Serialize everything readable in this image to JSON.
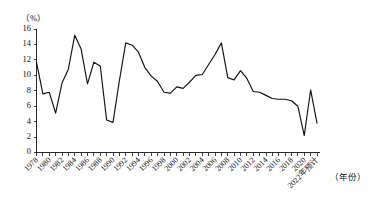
{
  "chart_data": {
    "type": "line",
    "title": "",
    "xlabel": "（年份）",
    "ylabel": "（%）",
    "ylim": [
      0,
      16
    ],
    "ytick_step": 2,
    "yticks": [
      0,
      2,
      4,
      6,
      8,
      10,
      12,
      14,
      16
    ],
    "grid": false,
    "legend": "none",
    "x": [
      "1978",
      "1979",
      "1980",
      "1981",
      "1982",
      "1983",
      "1984",
      "1985",
      "1986",
      "1987",
      "1988",
      "1989",
      "1990",
      "1991",
      "1992",
      "1993",
      "1994",
      "1995",
      "1996",
      "1997",
      "1998",
      "1999",
      "2000",
      "2001",
      "2002",
      "2003",
      "2004",
      "2005",
      "2006",
      "2007",
      "2008",
      "2009",
      "2010",
      "2011",
      "2012",
      "2013",
      "2014",
      "2015",
      "2016",
      "2017",
      "2018",
      "2019",
      "2020",
      "2021",
      "2022"
    ],
    "xtick_labels": [
      "1978",
      "1980",
      "1982",
      "1984",
      "1986",
      "1988",
      "1990",
      "1992",
      "1994",
      "1996",
      "1998",
      "2000",
      "2002",
      "2004",
      "2006",
      "2008",
      "2010",
      "2012",
      "2014",
      "2016",
      "2018",
      "2020",
      "2022年预计"
    ],
    "values": [
      11.7,
      7.6,
      7.8,
      5.1,
      9.0,
      10.8,
      15.2,
      13.4,
      8.9,
      11.7,
      11.2,
      4.2,
      3.9,
      9.3,
      14.2,
      13.9,
      13.0,
      11.0,
      9.9,
      9.2,
      7.8,
      7.7,
      8.5,
      8.3,
      9.1,
      10.0,
      10.1,
      11.4,
      12.7,
      14.2,
      9.7,
      9.4,
      10.6,
      9.6,
      7.9,
      7.8,
      7.4,
      7.0,
      6.9,
      6.9,
      6.7,
      6.0,
      2.2,
      8.1,
      3.8
    ],
    "series_name": "国内生产总值增长率"
  },
  "labels": {
    "y_unit": "（%）",
    "x_axis_caption": "（年份）"
  }
}
